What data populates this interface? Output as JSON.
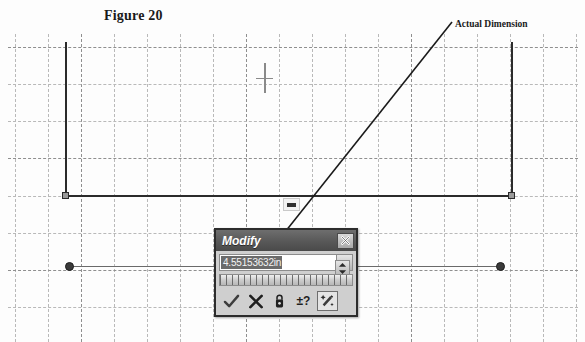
{
  "figure": {
    "title": "Figure 20"
  },
  "annotations": {
    "callout_label": "Actual Dimension"
  },
  "dialog": {
    "title": "Modify",
    "close_label": "X",
    "value": "4.55153632in",
    "value_placeholder": "0.00000000in",
    "dropdown_icon": "chevron-down-icon",
    "spinner_icon": "spinner-up-down-icon",
    "ruler_icon": "dimension-ruler",
    "buttons": [
      {
        "name": "accept-button",
        "icon": "checkmark-icon",
        "label": "Accept",
        "pressed": false
      },
      {
        "name": "cancel-button",
        "icon": "cross-icon",
        "label": "Cancel",
        "pressed": false
      },
      {
        "name": "lock-button",
        "icon": "padlock-icon",
        "label": "Lock",
        "pressed": false
      },
      {
        "name": "tolerance-button",
        "icon": "plus-minus-question-icon",
        "label": "±?",
        "pressed": false
      },
      {
        "name": "measure-button",
        "icon": "magic-wand-icon",
        "label": "Measure",
        "pressed": true
      }
    ]
  },
  "canvas": {
    "grid": {
      "minor_color": "#b9b9b9",
      "major_color": "#8f8f8f",
      "x_spacing": 33,
      "y_spacing": 37
    },
    "sketch": {
      "line_color": "#2b2b2b",
      "rectangle": {
        "left": 65,
        "right": 511,
        "top": 42,
        "bottom": 195
      },
      "dimension_line": {
        "left": 69,
        "right": 500,
        "y": 266
      },
      "vertical_dimension_marker": {
        "x": 264,
        "y_top": 63,
        "y_bottom": 92
      },
      "horizontal_dimension_placeholder": {
        "x": 283,
        "y": 198
      }
    }
  }
}
